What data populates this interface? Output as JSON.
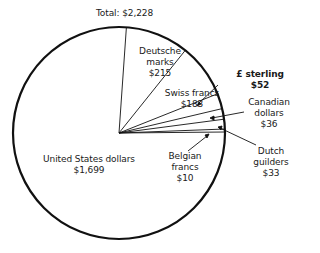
{
  "chart_data": {
    "type": "pie",
    "title": "Total: $2,228",
    "total": 2228,
    "unit": "$",
    "start_angle_deg": -86,
    "direction": "clockwise",
    "slices": [
      {
        "label": "Deutsche marks",
        "value": 215,
        "display": "$215"
      },
      {
        "label": "Swiss francs",
        "value": 183,
        "display": "$183"
      },
      {
        "label": "£ sterling",
        "value": 52,
        "display": "$52"
      },
      {
        "label": "Canadian dollars",
        "value": 36,
        "display": "$36"
      },
      {
        "label": "Dutch guilders",
        "value": 33,
        "display": "$33"
      },
      {
        "label": "Belgian francs",
        "value": 10,
        "display": "$10"
      },
      {
        "label": "United States dollars",
        "value": 1699,
        "display": "$1,699"
      }
    ],
    "legend": "none (labels placed on/around slices)",
    "colors": {
      "stroke": "#111111",
      "fill": "#ffffff",
      "text": "#1a1a1a"
    }
  },
  "labels": {
    "total": "Total: $2,228",
    "dm_1": "Deutsche",
    "dm_2": "marks",
    "dm_3": "$215",
    "swiss_1": "Swiss francs",
    "swiss_2": "$183",
    "sterling_1": "£ sterling",
    "sterling_2": "$52",
    "cad_1": "Canadian",
    "cad_2": "dollars",
    "cad_3": "$36",
    "dutch_1": "Dutch",
    "dutch_2": "guilders",
    "dutch_3": "$33",
    "belg_1": "Belgian",
    "belg_2": "francs",
    "belg_3": "$10",
    "usd_1": "United States dollars",
    "usd_2": "$1,699"
  }
}
